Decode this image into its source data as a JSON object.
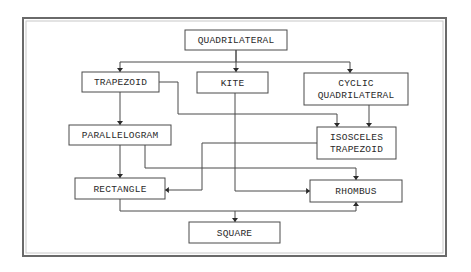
{
  "diagram": {
    "type": "flowchart",
    "title": "",
    "frame": {
      "x": 23,
      "y": 18,
      "w": 423,
      "h": 238
    },
    "nodes": [
      {
        "id": "quadrilateral",
        "lines": [
          "QUADRILATERAL"
        ],
        "x": 185,
        "y": 30,
        "w": 102,
        "h": 20
      },
      {
        "id": "trapezoid",
        "lines": [
          "TRAPEZOID"
        ],
        "x": 82,
        "y": 72,
        "w": 77,
        "h": 20
      },
      {
        "id": "kite",
        "lines": [
          "KITE"
        ],
        "x": 197,
        "y": 72,
        "w": 71,
        "h": 21
      },
      {
        "id": "cyclic-quadrilateral",
        "lines": [
          "CYCLIC",
          "QUADRILATERAL"
        ],
        "x": 304,
        "y": 73,
        "w": 104,
        "h": 32
      },
      {
        "id": "parallelogram",
        "lines": [
          "PARALLELOGRAM"
        ],
        "x": 69,
        "y": 125,
        "w": 102,
        "h": 20
      },
      {
        "id": "isosceles-trapezoid",
        "lines": [
          "ISOSCELES",
          "TRAPEZOID"
        ],
        "x": 317,
        "y": 127,
        "w": 79,
        "h": 32
      },
      {
        "id": "rectangle",
        "lines": [
          "RECTANGLE"
        ],
        "x": 75,
        "y": 178,
        "w": 90,
        "h": 21
      },
      {
        "id": "rhombus",
        "lines": [
          "RHOMBUS"
        ],
        "x": 310,
        "y": 180,
        "w": 92,
        "h": 22
      },
      {
        "id": "square",
        "lines": [
          "SQUARE"
        ],
        "x": 189,
        "y": 222,
        "w": 91,
        "h": 21
      }
    ],
    "edges": [
      {
        "from": "quadrilateral",
        "to": "trapezoid",
        "points": [
          [
            236,
            50
          ],
          [
            236,
            62
          ],
          [
            120,
            62
          ],
          [
            120,
            72
          ]
        ]
      },
      {
        "from": "quadrilateral",
        "to": "kite",
        "points": [
          [
            236,
            50
          ],
          [
            236,
            72
          ]
        ]
      },
      {
        "from": "quadrilateral",
        "to": "cyclic-quadrilateral",
        "points": [
          [
            236,
            62
          ],
          [
            350,
            62
          ],
          [
            350,
            73
          ]
        ]
      },
      {
        "from": "trapezoid",
        "to": "parallelogram",
        "points": [
          [
            120,
            92
          ],
          [
            120,
            125
          ]
        ]
      },
      {
        "from": "trapezoid",
        "to": "isosceles-trapezoid",
        "points": [
          [
            159,
            82
          ],
          [
            178,
            82
          ],
          [
            178,
            114
          ],
          [
            337,
            114
          ],
          [
            337,
            127
          ]
        ]
      },
      {
        "from": "cyclic-quadrilateral",
        "to": "isosceles-trapezoid",
        "points": [
          [
            369,
            105
          ],
          [
            369,
            127
          ]
        ]
      },
      {
        "from": "isosceles-trapezoid",
        "to": "rectangle",
        "points": [
          [
            317,
            143
          ],
          [
            202,
            143
          ],
          [
            202,
            190
          ],
          [
            165,
            190
          ]
        ]
      },
      {
        "from": "parallelogram",
        "to": "rectangle",
        "points": [
          [
            120,
            145
          ],
          [
            120,
            178
          ]
        ]
      },
      {
        "from": "parallelogram",
        "to": "rhombus",
        "points": [
          [
            145,
            145
          ],
          [
            145,
            168
          ],
          [
            356,
            168
          ],
          [
            356,
            180
          ]
        ]
      },
      {
        "from": "kite",
        "to": "rhombus",
        "points": [
          [
            235,
            93
          ],
          [
            235,
            191
          ],
          [
            310,
            191
          ]
        ]
      },
      {
        "from": "rectangle",
        "to": "square",
        "points": [
          [
            120,
            199
          ],
          [
            120,
            211
          ],
          [
            356,
            211
          ],
          [
            356,
            202
          ]
        ]
      },
      {
        "from": "rectangle",
        "to": "square",
        "points": [
          [
            235,
            211
          ],
          [
            235,
            222
          ]
        ]
      }
    ]
  }
}
